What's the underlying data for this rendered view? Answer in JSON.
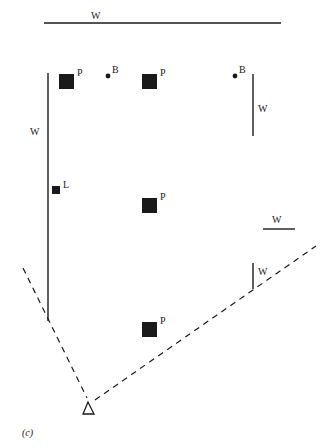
{
  "diagram": {
    "caption": "(c)",
    "legend_meaning": {
      "W": "wall",
      "P": "pillar",
      "B": "ball",
      "L": "light"
    },
    "walls": [
      {
        "id": "top",
        "label": "W",
        "x1": 44,
        "y1": 23,
        "x2": 281,
        "y2": 23,
        "lx": 91,
        "ly": 11
      },
      {
        "id": "left",
        "label": "W",
        "x1": 48,
        "y1": 73,
        "x2": 48,
        "y2": 321,
        "lx": 30,
        "ly": 127
      },
      {
        "id": "right-upper",
        "label": "W",
        "x1": 253,
        "y1": 74,
        "x2": 253,
        "y2": 136,
        "lx": 258,
        "ly": 104
      },
      {
        "id": "right-mid",
        "label": "W",
        "x1": 263,
        "y1": 229,
        "x2": 295,
        "y2": 229,
        "lx": 272,
        "ly": 215
      },
      {
        "id": "right-lower",
        "label": "W",
        "x1": 253,
        "y1": 263,
        "x2": 253,
        "y2": 289,
        "lx": 258,
        "ly": 267
      }
    ],
    "pillars": [
      {
        "label": "P",
        "x": 59,
        "y": 74,
        "size": 15
      },
      {
        "label": "P",
        "x": 142,
        "y": 74,
        "size": 15
      },
      {
        "label": "P",
        "x": 142,
        "y": 198,
        "size": 15
      },
      {
        "label": "P",
        "x": 142,
        "y": 322,
        "size": 15
      }
    ],
    "balls": [
      {
        "label": "B",
        "x": 108,
        "y": 76
      },
      {
        "label": "B",
        "x": 235,
        "y": 76
      }
    ],
    "lights": [
      {
        "label": "L",
        "x": 52,
        "y": 186,
        "size": 8
      }
    ],
    "viewer": {
      "shape": "triangle",
      "x": 88,
      "y": 408
    },
    "view_cone": [
      {
        "x1": 23,
        "y1": 268,
        "x2": 87,
        "y2": 398
      },
      {
        "x1": 95,
        "y1": 400,
        "x2": 316,
        "y2": 246
      }
    ],
    "colors": {
      "ink": "#1a1a1a",
      "background": "#ffffff"
    }
  }
}
